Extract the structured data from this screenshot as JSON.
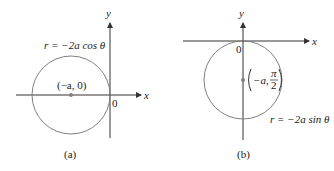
{
  "colors": {
    "axis": "#333333",
    "circle": "#808080",
    "point": "#808080",
    "text": "#222222"
  },
  "panels": [
    {
      "id": "a",
      "caption": "(a)",
      "equation": "r = −2a cos θ",
      "center_label": "(−a, 0)",
      "axis_x_label": "x",
      "axis_y_label": "y",
      "origin_label": "0"
    },
    {
      "id": "b",
      "caption": "(b)",
      "equation": "r = −2a sin θ",
      "center_label_prefix": "−a,",
      "center_label_frac_num": "π",
      "center_label_frac_den": "2",
      "axis_x_label": "x",
      "axis_y_label": "y",
      "origin_label": "0"
    }
  ]
}
